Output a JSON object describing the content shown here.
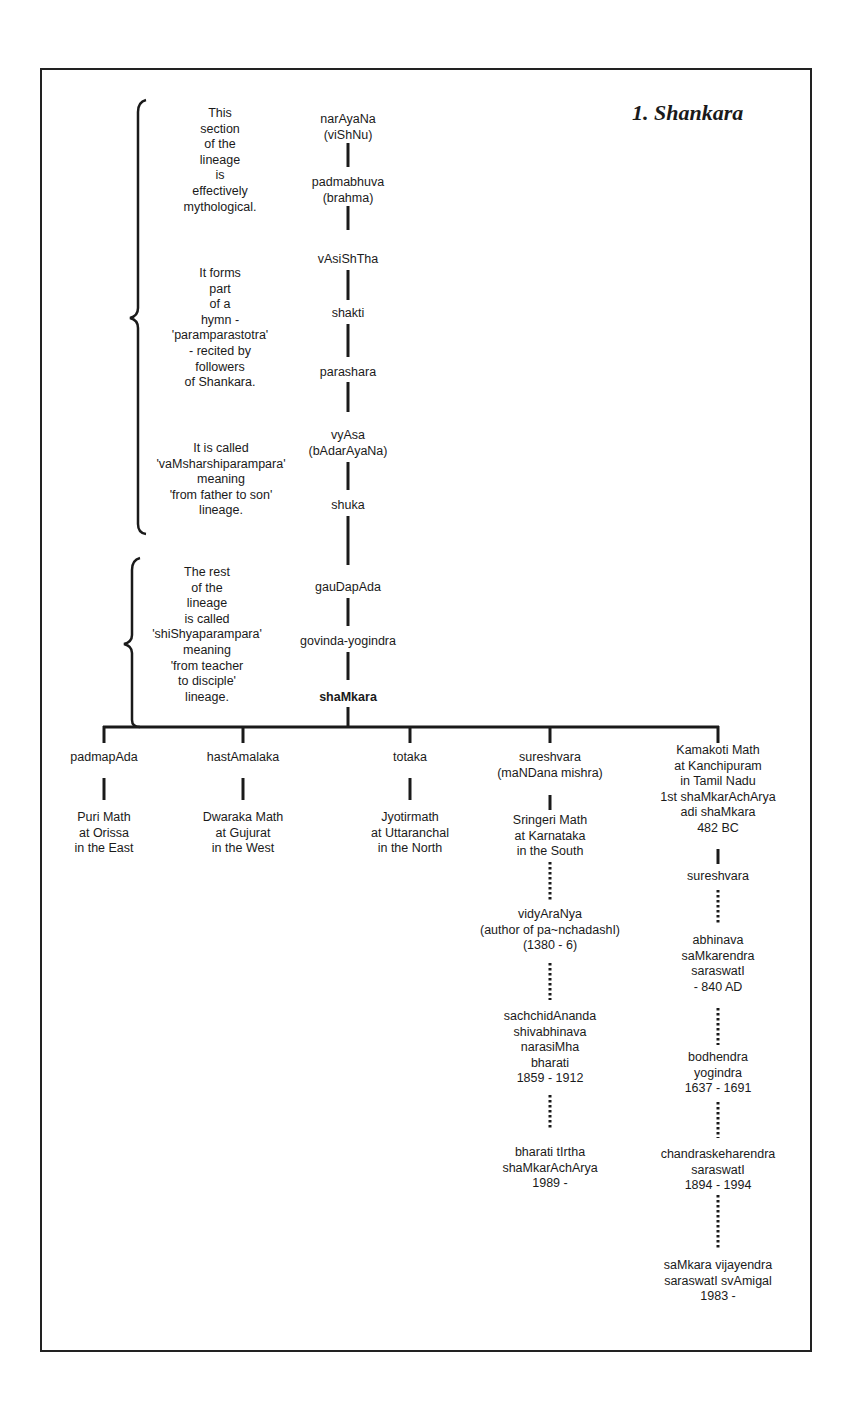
{
  "title": "1. Shankara",
  "notes": {
    "mythological": [
      "This",
      "section",
      "of the",
      "lineage",
      "is",
      "effectively",
      "mythological."
    ],
    "hymn": [
      "It forms",
      "part",
      "of a",
      "hymn -",
      "'paramparastotra'",
      "- recited by",
      "followers",
      "of Shankara."
    ],
    "vamsha": [
      "It is called",
      "'vaMsharshiparampara'",
      "meaning",
      "'from father to son'",
      "lineage."
    ],
    "shishya": [
      "The rest",
      "of the",
      "lineage",
      "is called",
      "'shiShyaparampara'",
      "meaning",
      "'from teacher",
      "to disciple'",
      "lineage."
    ]
  },
  "main_lineage": [
    [
      "narAyaNa",
      "(viShNu)"
    ],
    [
      "padmabhuva",
      "(brahma)"
    ],
    [
      "vAsiShTha"
    ],
    [
      "shakti"
    ],
    [
      "parashara"
    ],
    [
      "vyAsa",
      "(bAdarAyaNa)"
    ],
    [
      "shuka"
    ],
    [
      "gauDapAda"
    ],
    [
      "govinda-yogindra"
    ],
    [
      "shaMkara"
    ]
  ],
  "disciples": {
    "padmapada": {
      "name": [
        "padmapAda"
      ],
      "math": [
        "Puri Math",
        "at Orissa",
        "in the East"
      ]
    },
    "hastamalaka": {
      "name": [
        "hastAmalaka"
      ],
      "math": [
        "Dwaraka Math",
        "at Gujurat",
        "in the West"
      ]
    },
    "totaka": {
      "name": [
        "totaka"
      ],
      "math": [
        "Jyotirmath",
        "at Uttaranchal",
        "in the North"
      ]
    },
    "sureshvara": {
      "name": [
        "sureshvara",
        "(maNDana mishra)"
      ],
      "math": [
        "Sringeri Math",
        "at Karnataka",
        "in the South"
      ],
      "successors": [
        [
          "vidyAraNya",
          "(author of pa~nchadashI)",
          "(1380 - 6)"
        ],
        [
          "sachchidAnanda",
          "shivabhinava",
          "narasiMha",
          "bharati",
          "1859 - 1912"
        ],
        [
          "bharati tIrtha",
          "shaMkarAchArya",
          "1989 -"
        ]
      ]
    },
    "kamakoti": {
      "name": [
        "Kamakoti Math",
        "at Kanchipuram",
        "in Tamil Nadu",
        "1st shaMkarAchArya",
        "adi shaMkara",
        "482 BC"
      ],
      "successors": [
        [
          "sureshvara"
        ],
        [
          "abhinava",
          "saMkarendra",
          "saraswatI",
          "- 840 AD"
        ],
        [
          "bodhendra",
          "yogindra",
          "1637 - 1691"
        ],
        [
          "chandraskeharendra",
          "saraswatI",
          "1894 - 1994"
        ],
        [
          "saMkara vijayendra",
          "saraswatI svAmigal",
          "1983 -"
        ]
      ]
    }
  },
  "colors": {
    "ink": "#1a1a1a",
    "background": "#ffffff"
  }
}
